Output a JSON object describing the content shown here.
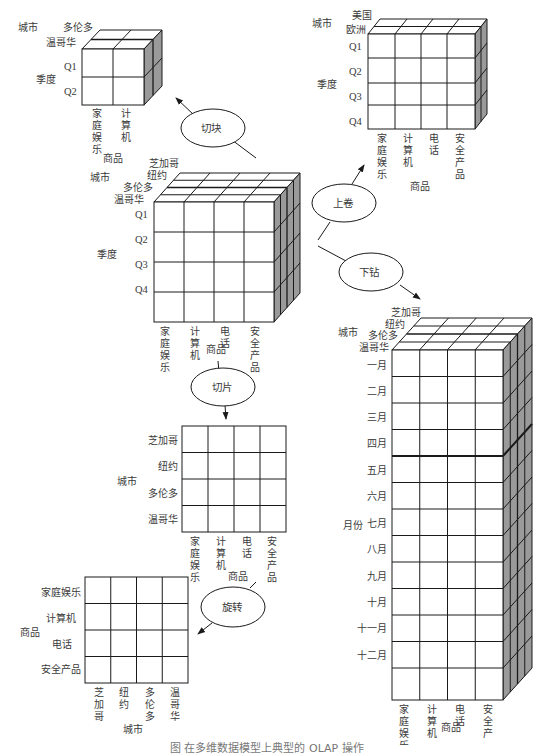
{
  "diagram": {
    "caption": "图 在多维数据模型上典型的 OLAP 操作",
    "operations": {
      "dice": "切块",
      "roll_up": "上卷",
      "drill_down": "下钻",
      "slice": "切片",
      "pivot": "旋转"
    },
    "axis_names": {
      "city": "城市",
      "quarter": "季度",
      "item": "商品",
      "month": "月份"
    },
    "items": [
      "家庭娱乐",
      "计算机",
      "电话",
      "安全产品"
    ],
    "items_vertical": [
      [
        "家",
        "庭",
        "娱",
        "乐"
      ],
      [
        "计",
        "算",
        "机"
      ],
      [
        "电",
        "话"
      ],
      [
        "安",
        "全",
        "产",
        "品"
      ]
    ],
    "cities": [
      "芝加哥",
      "纽约",
      "多伦多",
      "温哥华"
    ],
    "cities_vertical": [
      [
        "芝",
        "加",
        "哥"
      ],
      [
        "纽",
        "约"
      ],
      [
        "多",
        "伦",
        "多"
      ],
      [
        "温",
        "哥",
        "华"
      ]
    ],
    "quarters": [
      "Q1",
      "Q2",
      "Q3",
      "Q4"
    ],
    "regions": [
      "美国",
      "欧洲"
    ],
    "months": [
      "一月",
      "二月",
      "三月",
      "四月",
      "五月",
      "六月",
      "七月",
      "八月",
      "九月",
      "十月",
      "十一月",
      "十二月"
    ],
    "cubes": {
      "central": {
        "city_labels": [
          "芝加哥",
          "纽约",
          "多伦多",
          "温哥华"
        ],
        "row_labels": [
          "Q1",
          "Q2",
          "Q3",
          "Q4"
        ],
        "col_labels": [
          "家庭娱乐",
          "计算机",
          "电话",
          "安全产品"
        ],
        "depth_label": "城市",
        "row_axis": "季度",
        "col_axis": "商品",
        "top_axis": "商品"
      },
      "dice": {
        "city_labels": [
          "多伦多",
          "温哥华"
        ],
        "row_labels": [
          "Q1",
          "Q2"
        ],
        "col_labels": [
          "家庭娱乐",
          "计算机"
        ],
        "depth_label": "城市",
        "row_axis": "季度",
        "col_axis": "商品"
      },
      "roll_up": {
        "city_labels": [
          "美国",
          "欧洲"
        ],
        "row_labels": [
          "Q1",
          "Q2",
          "Q3",
          "Q4"
        ],
        "col_labels": [
          "家庭娱乐",
          "计算机",
          "电话",
          "安全产品"
        ],
        "depth_label": "城市",
        "row_axis": "季度",
        "col_axis": "商品"
      },
      "drill_down": {
        "city_labels": [
          "芝加哥",
          "纽约",
          "多伦多",
          "温哥华"
        ],
        "row_labels": [
          "一月",
          "二月",
          "三月",
          "四月",
          "五月",
          "六月",
          "七月",
          "八月",
          "九月",
          "十月",
          "十一月",
          "十二月"
        ],
        "col_labels": [
          "家庭娱乐",
          "计算机",
          "电话",
          "安全产品"
        ],
        "depth_label": "城市",
        "row_axis": "月份",
        "col_axis": "商品"
      },
      "slice": {
        "row_labels": [
          "芝加哥",
          "纽约",
          "多伦多",
          "温哥华"
        ],
        "col_labels": [
          "家庭娱乐",
          "计算机",
          "电话",
          "安全产品"
        ],
        "row_axis": "城市",
        "col_axis": "商品"
      },
      "pivot": {
        "row_labels": [
          "家庭娱乐",
          "计算机",
          "电话",
          "安全产品"
        ],
        "col_labels": [
          "芝加哥",
          "纽约",
          "多伦多",
          "温哥华"
        ],
        "row_axis": "商品",
        "col_axis": "城市"
      }
    },
    "colors": {
      "line": "#1a1a1a",
      "side_face": "#9a9a9a",
      "text": "#3a3a3a",
      "background": "#ffffff"
    }
  }
}
